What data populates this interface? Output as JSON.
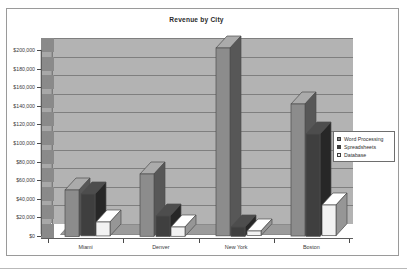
{
  "chart_data": {
    "type": "bar",
    "title": "Revenue by City",
    "xlabel": "",
    "ylabel": "",
    "categories": [
      "Miami",
      "Denver",
      "New York",
      "Boston"
    ],
    "series": [
      {
        "name": "Word Processing",
        "color": "#8c8c8c",
        "values": [
          50000,
          67000,
          202000,
          142000
        ]
      },
      {
        "name": "Spreadsheets",
        "color": "#3f3f3f",
        "values": [
          45000,
          22000,
          10000,
          110000
        ]
      },
      {
        "name": "Database",
        "color": "#f2f2f2",
        "values": [
          15000,
          10000,
          5000,
          33000
        ]
      }
    ],
    "ylim": [
      0,
      200000
    ],
    "ytick_values": [
      0,
      20000,
      40000,
      60000,
      80000,
      100000,
      120000,
      140000,
      160000,
      180000,
      200000
    ],
    "ytick_labels": [
      "$0",
      "$20,000",
      "$40,000",
      "$60,000",
      "$80,000",
      "$100,000",
      "$120,000",
      "$140,000",
      "$160,000",
      "$180,000",
      "$200,000"
    ],
    "grid": true,
    "legend_position": "right",
    "style": "3d-column",
    "plot_background": "#b3b3b3",
    "page_background": "#ffffff"
  },
  "legend": {
    "items": [
      {
        "label": "Word Processing",
        "color": "#8c8c8c"
      },
      {
        "label": "Spreadsheets",
        "color": "#3f3f3f"
      },
      {
        "label": "Database",
        "color": "#f2f2f2"
      }
    ]
  }
}
